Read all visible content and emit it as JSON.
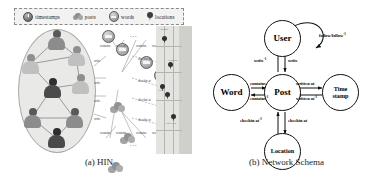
{
  "figure": {
    "panel_a": {
      "caption": "(a) HIN",
      "legend": [
        {
          "icon": "clock-icon",
          "label": "timestamps"
        },
        {
          "icon": "cloud-icon",
          "label": "posts"
        },
        {
          "icon": "word-bubble-icon",
          "label": "words"
        },
        {
          "icon": "map-pin-icon",
          "label": "locations"
        }
      ],
      "edge_labels_top": [
        "contains",
        "contains",
        "contains",
        "contains"
      ],
      "edge_labels_bottom": [
        "contains",
        "contains",
        "contains",
        "contains"
      ],
      "edge_labels_left": [
        "write",
        "write",
        "write",
        "write"
      ],
      "edge_labels_right": [
        "checkin at",
        "checkin at",
        "checkin at",
        "checkin at"
      ],
      "ellipsis": "...",
      "map_labels": [
        "Chicago",
        "Evanston",
        "Cicero",
        "Oak Lawn"
      ]
    },
    "panel_b": {
      "caption": "(b) Network Schema",
      "nodes": [
        {
          "id": "user",
          "label": "User"
        },
        {
          "id": "post",
          "label": "Post"
        },
        {
          "id": "word",
          "label": "Word"
        },
        {
          "id": "timestamp",
          "label_line1": "Time",
          "label_line2": "stamp"
        },
        {
          "id": "location",
          "label": "Location"
        }
      ],
      "edges": [
        {
          "from": "user",
          "to": "user",
          "label": "follow/follow",
          "superscript": "-1"
        },
        {
          "from": "post",
          "to": "user",
          "label": "write",
          "superscript": "-1"
        },
        {
          "from": "user",
          "to": "post",
          "label": "write",
          "superscript": ""
        },
        {
          "from": "word",
          "to": "post",
          "label": "contains",
          "superscript": ""
        },
        {
          "from": "post",
          "to": "word",
          "label": "contains",
          "superscript": "-1"
        },
        {
          "from": "post",
          "to": "timestamp",
          "label": "written at",
          "superscript": ""
        },
        {
          "from": "timestamp",
          "to": "post",
          "label": "written at",
          "superscript": "-1"
        },
        {
          "from": "post",
          "to": "location",
          "label": "checkin at",
          "superscript": "-1"
        },
        {
          "from": "location",
          "to": "post",
          "label": "checkin at",
          "superscript": ""
        }
      ]
    },
    "colors": {
      "ink": "#111111",
      "legend_bg": "#f2f2f0",
      "ellipse_bg": "#e9e9e7",
      "map_land": "#e3e3e0",
      "map_water": "#cfcfcc"
    }
  }
}
